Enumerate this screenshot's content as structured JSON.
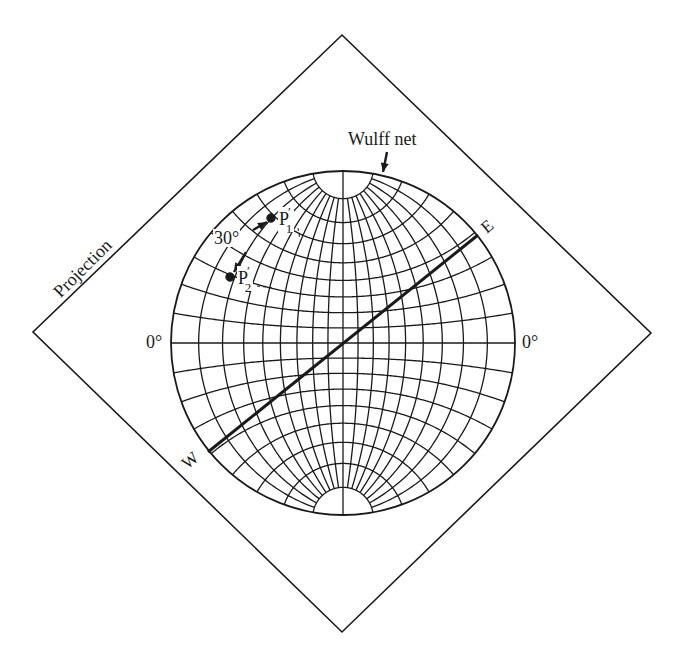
{
  "figure": {
    "panel_label": "(b)",
    "labels": {
      "wulff_net": "Wulff net",
      "projection": "Projection",
      "zero_left": "0°",
      "zero_right": "0°",
      "east": "E",
      "west": "W",
      "angle": "30°",
      "p1_base": "P",
      "p1_prime": "′",
      "p1_sub": "1",
      "p2_base": "P",
      "p2_prime": "′",
      "p2_sub": "2"
    },
    "geometry": {
      "diamond": {
        "top": [
          342,
          35
        ],
        "right": [
          651,
          333
        ],
        "bottom": [
          342,
          632
        ],
        "left": [
          33,
          332
        ]
      },
      "net": {
        "cx": 343,
        "cy": 343,
        "r": 172,
        "grid_step_deg": 10,
        "cap_latitude_deg": 80
      },
      "great_circle_line": {
        "from_label": "W",
        "to_label": "E",
        "start": [
          208,
          452
        ],
        "end": [
          478,
          235
        ]
      },
      "points": [
        {
          "name": "P1'",
          "x": 271,
          "y": 218
        },
        {
          "name": "P2'",
          "x": 230,
          "y": 277
        }
      ],
      "angle_between_points_deg": 30
    },
    "colors": {
      "ink": "#1a1a1a",
      "background": "#ffffff"
    }
  }
}
